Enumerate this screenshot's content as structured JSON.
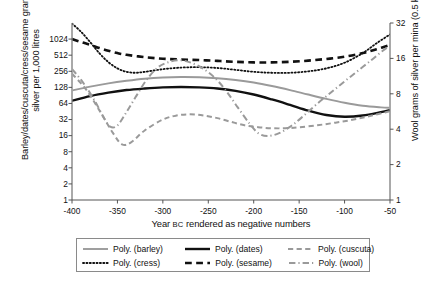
{
  "chart_data": {
    "type": "line",
    "title": "",
    "xlabel": "Year BC rendered as negative numbers",
    "xlabel_main": "Year ",
    "xlabel_smallcaps": "BC",
    "xlabel_tail": " rendered as negative numbers",
    "ylabel": "Barley/dates/cuscuta/cress/sesame grams of silver per 1,000 litres",
    "ylabel_right": "Wool grams of silver per mina (0.5 kg)",
    "yscale": "log2",
    "y_right_scale": "log2",
    "xlim": [
      -400,
      -50
    ],
    "ylim": [
      1,
      2048
    ],
    "ylim_right": [
      1,
      32
    ],
    "grid": false,
    "legend_position": "below-plot",
    "xticks": [
      -400,
      -350,
      -300,
      -250,
      -200,
      -150,
      -100,
      -50
    ],
    "xtick_labels": [
      "-400",
      "-350",
      "-300",
      "-250",
      "-200",
      "-150",
      "-100",
      "-50"
    ],
    "yticks": [
      1,
      2,
      4,
      8,
      16,
      32,
      64,
      128,
      256,
      512,
      1024
    ],
    "ytick_labels": [
      "1",
      "2",
      "4",
      "8",
      "16",
      "32",
      "64",
      "128",
      "256",
      "512",
      "1024"
    ],
    "yticks_right": [
      1,
      2,
      4,
      8,
      16,
      32
    ],
    "ytick_labels_right": [
      "1",
      "2",
      "4",
      "8",
      "16",
      "32"
    ],
    "series": [
      {
        "name": "Poly. (barley)",
        "key": "barley",
        "style": "solid",
        "color": "#9a9a9a",
        "width": 1.9,
        "axis": "left",
        "x": [
          -400,
          -380,
          -360,
          -340,
          -320,
          -300,
          -280,
          -260,
          -240,
          -220,
          -200,
          -180,
          -160,
          -140,
          -120,
          -100,
          -80,
          -60,
          -50
        ],
        "y": [
          112,
          132,
          152,
          170,
          186,
          196,
          200,
          198,
          190,
          176,
          158,
          136,
          114,
          94,
          78,
          66,
          58,
          54,
          53
        ]
      },
      {
        "name": "Poly. (dates)",
        "key": "dates",
        "style": "solid",
        "color": "#111111",
        "width": 2.4,
        "axis": "left",
        "x": [
          -400,
          -380,
          -360,
          -340,
          -320,
          -300,
          -280,
          -260,
          -240,
          -220,
          -200,
          -180,
          -160,
          -140,
          -120,
          -100,
          -80,
          -60,
          -50
        ],
        "y": [
          72,
          88,
          102,
          114,
          122,
          128,
          130,
          128,
          122,
          110,
          94,
          76,
          60,
          47,
          39,
          36,
          38,
          44,
          48
        ]
      },
      {
        "name": "Poly. (cuscuta)",
        "key": "cuscuta",
        "style": "dashed",
        "color": "#9a9a9a",
        "width": 2.0,
        "axis": "left",
        "x": [
          -400,
          -385,
          -370,
          -355,
          -345,
          -335,
          -320,
          -300,
          -285,
          -270,
          -255,
          -240,
          -225,
          -210,
          -195,
          -180,
          -165,
          -150,
          -130,
          -110,
          -90,
          -70,
          -50
        ],
        "y": [
          230,
          120,
          48,
          18,
          11,
          12,
          20,
          32,
          38,
          40,
          38,
          34,
          29,
          25,
          23,
          22,
          22,
          23,
          25,
          28,
          32,
          38,
          46
        ]
      },
      {
        "name": "Poly. (cress)",
        "key": "cress",
        "style": "dotted",
        "color": "#111111",
        "width": 1.8,
        "axis": "left",
        "x": [
          -400,
          -390,
          -380,
          -370,
          -360,
          -350,
          -340,
          -330,
          -320,
          -300,
          -280,
          -260,
          -240,
          -220,
          -200,
          -180,
          -160,
          -140,
          -120,
          -100,
          -80,
          -65,
          -50
        ],
        "y": [
          2000,
          1400,
          900,
          560,
          380,
          290,
          250,
          240,
          250,
          280,
          300,
          305,
          295,
          272,
          250,
          240,
          240,
          255,
          290,
          370,
          560,
          850,
          1250
        ]
      },
      {
        "name": "Poly. (sesame)",
        "key": "sesame",
        "style": "dashed",
        "color": "#111111",
        "width": 2.6,
        "axis": "left",
        "x": [
          -400,
          -390,
          -380,
          -370,
          -360,
          -350,
          -340,
          -320,
          -300,
          -280,
          -260,
          -240,
          -220,
          -200,
          -180,
          -160,
          -140,
          -120,
          -100,
          -80,
          -65,
          -50
        ],
        "y": [
          1024,
          900,
          800,
          700,
          620,
          560,
          520,
          470,
          440,
          425,
          415,
          400,
          385,
          375,
          375,
          385,
          405,
          435,
          480,
          560,
          660,
          800
        ]
      },
      {
        "name": "Poly. (wool)",
        "key": "wool",
        "style": "dashdot",
        "color": "#9a9a9a",
        "width": 2.0,
        "axis": "right",
        "x": [
          -400,
          -388,
          -375,
          -365,
          -358,
          -350,
          -340,
          -330,
          -318,
          -305,
          -292,
          -280,
          -268,
          -255,
          -242,
          -230,
          -218,
          -205,
          -195,
          -185,
          -172,
          -158,
          -145,
          -130,
          -115,
          -100,
          -85,
          -70,
          -58,
          -50
        ],
        "y": [
          13.0,
          10.0,
          7.0,
          5.0,
          4.2,
          4.3,
          5.6,
          7.5,
          10.5,
          13.5,
          15.0,
          15.4,
          14.6,
          13.0,
          10.8,
          8.4,
          6.2,
          4.5,
          3.7,
          3.5,
          3.7,
          4.3,
          5.2,
          6.6,
          8.2,
          10.2,
          12.6,
          15.6,
          18.6,
          20.5
        ]
      }
    ]
  },
  "legend": {
    "items": [
      {
        "label": "Poly. (barley)",
        "key": "barley",
        "row": 0,
        "col": 0
      },
      {
        "label": "Poly. (dates)",
        "key": "dates",
        "row": 0,
        "col": 1
      },
      {
        "label": "Poly. (cuscuta)",
        "key": "cuscuta",
        "row": 0,
        "col": 2
      },
      {
        "label": "Poly. (cress)",
        "key": "cress",
        "row": 1,
        "col": 0
      },
      {
        "label": "Poly. (sesame)",
        "key": "sesame",
        "row": 1,
        "col": 1
      },
      {
        "label": "Poly. (wool)",
        "key": "wool",
        "row": 1,
        "col": 2
      }
    ]
  },
  "colors": {
    "gray_series": "#9a9a9a",
    "black_series": "#111111",
    "axis": "#555555",
    "legend_border": "#8a8a8a",
    "background": "#ffffff"
  }
}
